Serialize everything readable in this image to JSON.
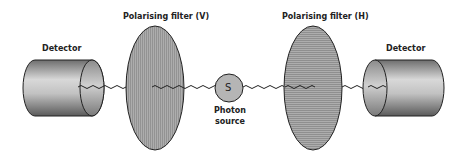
{
  "diagram": {
    "type": "photon-polarisation-experiment",
    "labels": {
      "detector_left": "Detector",
      "filter_left": "Polarising filter (V)",
      "source_letter": "S",
      "source_line1": "Photon",
      "source_line2": "source",
      "filter_right": "Polarising filter (H)",
      "detector_right": "Detector"
    },
    "colors": {
      "filter_fill": "#a9a9a9",
      "stripe": "#8e8e8e",
      "outline": "#222222",
      "source_fill": "#b5b5b5",
      "wave": "#222222"
    },
    "components": [
      {
        "id": "detector-left",
        "kind": "detector"
      },
      {
        "id": "filter-v",
        "kind": "polarising-filter",
        "orientation": "vertical"
      },
      {
        "id": "photon-source",
        "kind": "source"
      },
      {
        "id": "filter-h",
        "kind": "polarising-filter",
        "orientation": "horizontal"
      },
      {
        "id": "detector-right",
        "kind": "detector"
      }
    ]
  }
}
